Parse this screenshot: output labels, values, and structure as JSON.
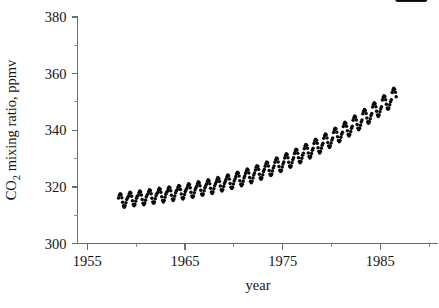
{
  "chart_data": {
    "type": "scatter",
    "title": "",
    "subtitle": "",
    "xlabel": "year",
    "ylabel": "CO2 mixing ratio, ppmv",
    "ylabel_display": "CO₂ mixing ratio, ppmv",
    "xlim": [
      1954.0,
      1990.9
    ],
    "ylim": [
      300,
      380
    ],
    "grid": false,
    "legend": null,
    "marker": "filled-circle",
    "marker_color": "#0a0a0a",
    "x_ticks_major": [
      1955,
      1965,
      1975,
      1985
    ],
    "x_ticks_major_labels": [
      "1955",
      "1965",
      "1975",
      "1985"
    ],
    "x_ticks_minor": [
      1960,
      1970,
      1980,
      1990
    ],
    "y_ticks_major": [
      300,
      320,
      340,
      360,
      380
    ],
    "y_ticks_major_labels": [
      "300",
      "320",
      "340",
      "360",
      "380"
    ],
    "y_ticks_minor": [
      310,
      330,
      350,
      370
    ],
    "series_name": "Mauna Loa monthly mean CO2",
    "x_start": 1958.2,
    "x_end": 1989.7,
    "sampling": "monthly",
    "trend_model": {
      "value_at_1958_2": 315.0,
      "value_at_1989_7": 352.0,
      "quadratic_curvature": 0.0125,
      "seasonal_amplitude_ppmv": 3.2,
      "seasonal_peak_month_fraction": 0.38,
      "seasonal_harmonic2_amplitude_ppmv": 0.85,
      "noise_amplitude_ppmv": 0.35
    },
    "x": [
      1958.2,
      1958.29,
      1958.37,
      1958.46,
      1958.54,
      1958.62,
      1958.71,
      1958.79,
      1958.87,
      1958.96,
      1959.04,
      1959.12,
      1959.21,
      1959.29,
      1959.37,
      1959.46,
      1959.54,
      1959.62,
      1959.71,
      1959.79,
      1959.87,
      1959.96,
      1960.04,
      1960.12,
      1960.21,
      1960.29,
      1960.37,
      1960.46,
      1960.54,
      1960.62,
      1960.71,
      1960.79,
      1960.87,
      1960.96,
      1961.04,
      1961.12,
      1961.21,
      1961.29,
      1961.37,
      1961.46,
      1961.54,
      1961.62,
      1961.71,
      1961.79,
      1961.87,
      1961.96,
      1962.04,
      1962.12,
      1962.21,
      1962.29,
      1962.37,
      1962.46,
      1962.54,
      1962.62,
      1962.71,
      1962.79,
      1962.87,
      1962.96,
      1963.04,
      1963.12,
      1963.21,
      1963.29,
      1963.37,
      1963.46,
      1963.54,
      1963.62,
      1963.71,
      1963.79,
      1963.87,
      1963.96,
      1964.04,
      1964.12,
      1964.21,
      1964.29,
      1964.37,
      1964.46,
      1964.54,
      1964.62,
      1964.71,
      1964.79,
      1964.87,
      1964.96,
      1965.04,
      1965.12,
      1965.21,
      1965.29,
      1965.37,
      1965.46,
      1965.54,
      1965.62,
      1965.71,
      1965.79,
      1965.87,
      1965.96,
      1966.04,
      1966.12,
      1966.21,
      1966.29,
      1966.37,
      1966.46,
      1966.54,
      1966.62,
      1966.71,
      1966.79,
      1966.87,
      1966.96,
      1967.04,
      1967.12,
      1967.21,
      1967.29,
      1967.37,
      1967.46,
      1967.54,
      1967.62,
      1967.71,
      1967.79,
      1967.87,
      1967.96,
      1968.04,
      1968.12,
      1968.21,
      1968.29,
      1968.37,
      1968.46,
      1968.54,
      1968.62,
      1968.71,
      1968.79,
      1968.87,
      1968.96,
      1969.04,
      1969.12,
      1969.21,
      1969.29,
      1969.37,
      1969.46,
      1969.54,
      1969.62,
      1969.71,
      1969.79,
      1969.87,
      1969.96,
      1970.04,
      1970.12,
      1970.21,
      1970.29,
      1970.37,
      1970.46,
      1970.54,
      1970.62,
      1970.71,
      1970.79,
      1970.87,
      1970.96,
      1971.04,
      1971.12,
      1971.21,
      1971.29,
      1971.37,
      1971.46,
      1971.54,
      1971.62,
      1971.71,
      1971.79,
      1971.87,
      1971.96,
      1972.04,
      1972.12,
      1972.21,
      1972.29,
      1972.37,
      1972.46,
      1972.54,
      1972.62,
      1972.71,
      1972.79,
      1972.87,
      1972.96,
      1973.04,
      1973.12,
      1973.21,
      1973.29,
      1973.37,
      1973.46,
      1973.54,
      1973.62,
      1973.71,
      1973.79,
      1973.87,
      1973.96,
      1974.04,
      1974.12,
      1974.21,
      1974.29,
      1974.37,
      1974.46,
      1974.54,
      1974.62,
      1974.71,
      1974.79,
      1974.87,
      1974.96,
      1975.04,
      1975.12,
      1975.21,
      1975.29,
      1975.37,
      1975.46,
      1975.54,
      1975.62,
      1975.71,
      1975.79,
      1975.87,
      1975.96,
      1976.04,
      1976.12,
      1976.21,
      1976.29,
      1976.37,
      1976.46,
      1976.54,
      1976.62,
      1976.71,
      1976.79,
      1976.87,
      1976.96,
      1977.04,
      1977.12,
      1977.21,
      1977.29,
      1977.37,
      1977.46,
      1977.54,
      1977.62,
      1977.71,
      1977.79,
      1977.87,
      1977.96,
      1978.04,
      1978.12,
      1978.21,
      1978.29,
      1978.37,
      1978.46,
      1978.54,
      1978.62,
      1978.71,
      1978.79,
      1978.87,
      1978.96,
      1979.04,
      1979.12,
      1979.21,
      1979.29,
      1979.37,
      1979.46,
      1979.54,
      1979.62,
      1979.71,
      1979.79,
      1979.87,
      1979.96,
      1980.04,
      1980.12,
      1980.21,
      1980.29,
      1980.37,
      1980.46,
      1980.54,
      1980.62,
      1980.71,
      1980.79,
      1980.87,
      1980.96,
      1981.04,
      1981.12,
      1981.21,
      1981.29,
      1981.37,
      1981.46,
      1981.54,
      1981.62,
      1981.71,
      1981.79,
      1981.87,
      1981.96,
      1982.04,
      1982.12,
      1982.21,
      1982.29,
      1982.37,
      1982.46,
      1982.54,
      1982.62,
      1982.71,
      1982.79,
      1982.87,
      1982.96,
      1983.04,
      1983.12,
      1983.21,
      1983.29,
      1983.37,
      1983.46,
      1983.54,
      1983.62,
      1983.71,
      1983.79,
      1983.87,
      1983.96,
      1984.04,
      1984.12,
      1984.21,
      1984.29,
      1984.37,
      1984.46,
      1984.54,
      1984.62,
      1984.71,
      1984.79,
      1984.87,
      1984.96,
      1985.04,
      1985.12,
      1985.21,
      1985.29,
      1985.37,
      1985.46,
      1985.54,
      1985.62,
      1985.71,
      1985.79,
      1985.87,
      1985.96,
      1986.04,
      1986.12,
      1986.21,
      1986.29,
      1986.37,
      1986.46,
      1986.54,
      1986.62,
      1986.71,
      1986.79,
      1986.87,
      1986.96,
      1987.04,
      1987.12,
      1987.21,
      1987.29,
      1987.37,
      1987.46,
      1987.54,
      1987.62,
      1987.71,
      1987.79,
      1987.87,
      1987.96,
      1988.04,
      1988.12,
      1988.21,
      1988.29,
      1988.37,
      1988.46,
      1988.54,
      1988.62,
      1988.71,
      1988.79,
      1988.87,
      1988.96,
      1989.04,
      1989.12,
      1989.21,
      1989.29,
      1989.37,
      1989.46,
      1989.54,
      1989.62
    ],
    "y": [
      316.1,
      317.0,
      317.6,
      317.3,
      316.2,
      314.6,
      313.3,
      312.8,
      313.3,
      314.4,
      315.5,
      316.2,
      316.6,
      317.5,
      318.1,
      317.8,
      316.7,
      315.1,
      313.8,
      313.3,
      313.8,
      314.9,
      316.0,
      316.7,
      317.0,
      317.9,
      318.5,
      318.2,
      317.1,
      315.5,
      314.2,
      313.7,
      314.2,
      315.3,
      316.4,
      317.1,
      317.5,
      318.4,
      319.0,
      318.7,
      317.6,
      316.0,
      314.7,
      314.2,
      314.7,
      315.8,
      316.9,
      317.6,
      318.0,
      318.9,
      319.5,
      319.2,
      318.1,
      316.5,
      315.2,
      314.7,
      315.2,
      316.3,
      317.4,
      318.1,
      318.5,
      319.4,
      320.0,
      319.7,
      318.6,
      317.0,
      315.7,
      315.2,
      315.7,
      316.8,
      317.9,
      318.6,
      319.0,
      319.9,
      320.5,
      320.2,
      319.1,
      317.5,
      316.2,
      315.7,
      316.2,
      317.3,
      318.4,
      319.1,
      319.6,
      320.5,
      321.1,
      320.8,
      319.7,
      318.1,
      316.8,
      316.3,
      316.8,
      317.9,
      319.0,
      319.7,
      320.3,
      321.2,
      321.8,
      321.5,
      320.4,
      318.8,
      317.5,
      317.0,
      317.5,
      318.6,
      319.7,
      320.4,
      321.0,
      321.9,
      322.5,
      322.2,
      321.1,
      319.5,
      318.2,
      317.7,
      318.2,
      319.3,
      320.4,
      321.1,
      321.8,
      322.7,
      323.3,
      323.0,
      321.9,
      320.3,
      319.0,
      318.5,
      319.0,
      320.1,
      321.2,
      321.9,
      322.7,
      323.6,
      324.2,
      323.9,
      322.8,
      321.2,
      319.9,
      319.4,
      319.9,
      321.0,
      322.1,
      322.8,
      323.7,
      324.6,
      325.2,
      324.9,
      323.8,
      322.2,
      320.9,
      320.4,
      320.9,
      322.0,
      323.1,
      323.8,
      324.8,
      325.7,
      326.3,
      326.0,
      324.9,
      323.3,
      322.0,
      321.5,
      322.0,
      323.1,
      324.2,
      324.9,
      326.0,
      326.9,
      327.5,
      327.2,
      326.1,
      324.5,
      323.2,
      322.7,
      323.2,
      324.3,
      325.4,
      326.1,
      327.3,
      328.2,
      328.8,
      328.5,
      327.4,
      325.8,
      324.5,
      324.0,
      324.5,
      325.6,
      326.7,
      327.4,
      328.7,
      329.6,
      330.2,
      329.9,
      328.8,
      327.2,
      325.9,
      325.4,
      325.9,
      327.0,
      328.1,
      328.8,
      330.2,
      331.1,
      331.7,
      331.4,
      330.3,
      328.7,
      327.4,
      326.9,
      327.4,
      328.5,
      329.6,
      330.3,
      331.8,
      332.7,
      333.3,
      333.0,
      331.9,
      330.3,
      329.0,
      328.5,
      329.0,
      330.1,
      331.2,
      331.9,
      333.5,
      334.4,
      335.0,
      334.7,
      333.6,
      332.0,
      330.7,
      330.2,
      330.7,
      331.8,
      332.9,
      333.6,
      335.3,
      336.2,
      336.8,
      336.5,
      335.4,
      333.8,
      332.5,
      332.0,
      332.5,
      333.6,
      334.7,
      335.4,
      337.2,
      338.1,
      338.7,
      338.4,
      337.3,
      335.7,
      334.4,
      333.9,
      334.4,
      335.5,
      336.6,
      337.3,
      339.2,
      340.1,
      340.7,
      340.4,
      339.3,
      337.7,
      336.4,
      335.9,
      336.4,
      337.5,
      338.6,
      339.3,
      341.3,
      342.2,
      342.8,
      342.5,
      341.4,
      339.8,
      338.5,
      338.0,
      338.5,
      339.6,
      340.7,
      341.4,
      343.5,
      344.4,
      345.0,
      344.7,
      343.6,
      342.0,
      340.7,
      340.2,
      340.7,
      341.8,
      342.9,
      343.6,
      345.8,
      346.7,
      347.3,
      347.0,
      345.9,
      344.3,
      343.0,
      342.5,
      343.0,
      344.1,
      345.2,
      345.9,
      348.2,
      349.1,
      349.7,
      349.4,
      348.3,
      346.7,
      345.4,
      344.9,
      345.4,
      346.5,
      347.6,
      348.3,
      350.7,
      351.6,
      352.2,
      351.9,
      350.8,
      349.2,
      347.9,
      347.4,
      347.9,
      349.0,
      350.1,
      350.8,
      353.3,
      354.2,
      354.8,
      354.5,
      353.4,
      351.8
    ]
  },
  "axes": {
    "y_title_main": "CO",
    "y_title_sub": "2",
    "y_title_rest": " mixing ratio, ppmv",
    "x_title": "year"
  }
}
